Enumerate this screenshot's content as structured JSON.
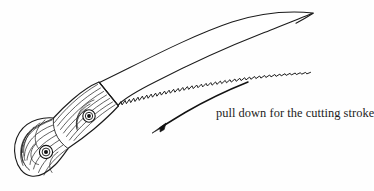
{
  "figure": {
    "title": "curved pruning saw illustration",
    "caption": "pull down for the cutting stroke",
    "background_color": "#fefefe",
    "ink_color": "#1b1b1b",
    "parts": {
      "blade_label": "curved saw blade",
      "teeth_label": "saw teeth",
      "handle_label": "wooden handle",
      "grain_label": "wood grain",
      "rivet_1_label": "handle rivet upper",
      "rivet_2_label": "handle rivet lower",
      "ferrule_label": "blade tang junction",
      "arrow_label": "cutting stroke direction arrow"
    }
  },
  "annotation": {
    "arrow": {
      "direction": "down-left",
      "start_x": 248,
      "start_y": 82,
      "tip_x": 152,
      "tip_y": 133
    },
    "text_x": 216,
    "text_y": 106
  }
}
